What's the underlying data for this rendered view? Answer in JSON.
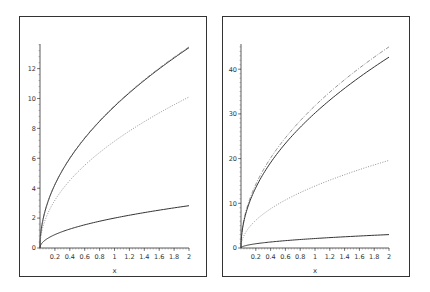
{
  "chart_data": [
    {
      "type": "line",
      "title": "",
      "xlabel": "x",
      "ylabel": "",
      "xlim": [
        0,
        2
      ],
      "ylim": [
        0,
        13.5
      ],
      "grid": false,
      "legend": null,
      "x_ticks": [
        "0.2",
        "0.4",
        "0.6",
        "0.8",
        "1",
        "1.2",
        "1.4",
        "1.6",
        "1.8",
        "2"
      ],
      "y_ticks": [
        "0",
        "2",
        "4",
        "6",
        "8",
        "10",
        "12"
      ],
      "x": [
        0,
        0.1,
        0.2,
        0.4,
        0.6,
        0.8,
        1.0,
        1.2,
        1.4,
        1.6,
        1.8,
        2.0
      ],
      "series": [
        {
          "name": "upper-solid",
          "style": "solid",
          "values": [
            0,
            3.0,
            4.24,
            6.0,
            7.35,
            8.49,
            9.49,
            10.39,
            11.22,
            12.0,
            12.73,
            13.4
          ]
        },
        {
          "name": "upper-dashdot",
          "style": "dashdot",
          "values": [
            0,
            3.0,
            4.24,
            6.0,
            7.35,
            8.49,
            9.49,
            10.39,
            11.22,
            12.0,
            12.73,
            13.45
          ]
        },
        {
          "name": "middle-dotted",
          "style": "dotted",
          "values": [
            0,
            2.26,
            3.19,
            4.52,
            5.53,
            6.39,
            7.14,
            7.82,
            8.45,
            9.03,
            9.58,
            10.1
          ]
        },
        {
          "name": "lower-solid",
          "style": "solid",
          "values": [
            0,
            0.63,
            0.89,
            1.26,
            1.55,
            1.79,
            2.0,
            2.19,
            2.37,
            2.53,
            2.68,
            2.83
          ]
        }
      ]
    },
    {
      "type": "line",
      "title": "",
      "xlabel": "x",
      "ylabel": "",
      "xlim": [
        0,
        2
      ],
      "ylim": [
        0,
        46
      ],
      "grid": false,
      "legend": null,
      "x_ticks": [
        "0.2",
        "0.4",
        "0.6",
        "0.8",
        "1",
        "1.2",
        "1.4",
        "1.6",
        "1.8",
        "2"
      ],
      "y_ticks": [
        "0",
        "10",
        "20",
        "30",
        "40"
      ],
      "x": [
        0,
        0.1,
        0.2,
        0.4,
        0.6,
        0.8,
        1.0,
        1.2,
        1.4,
        1.6,
        1.8,
        2.0
      ],
      "series": [
        {
          "name": "upper-dashdot",
          "style": "dashdot",
          "values": [
            0,
            10.1,
            14.3,
            20.1,
            24.7,
            28.5,
            31.9,
            34.9,
            37.7,
            40.3,
            42.7,
            45.0
          ]
        },
        {
          "name": "upper-solid",
          "style": "solid",
          "values": [
            0,
            9.5,
            13.5,
            19.1,
            23.4,
            27.0,
            30.2,
            33.1,
            35.7,
            38.2,
            40.5,
            42.7
          ]
        },
        {
          "name": "middle-dotted",
          "style": "dotted",
          "values": [
            0,
            4.4,
            6.2,
            8.8,
            10.7,
            12.4,
            13.9,
            15.2,
            16.4,
            17.5,
            18.6,
            19.6
          ]
        },
        {
          "name": "lower-solid",
          "style": "solid",
          "values": [
            0,
            0.67,
            0.95,
            1.34,
            1.64,
            1.9,
            2.12,
            2.32,
            2.51,
            2.68,
            2.85,
            3.0
          ]
        }
      ]
    }
  ],
  "panels": [
    {
      "xlabel": "x"
    },
    {
      "xlabel": "x"
    }
  ]
}
